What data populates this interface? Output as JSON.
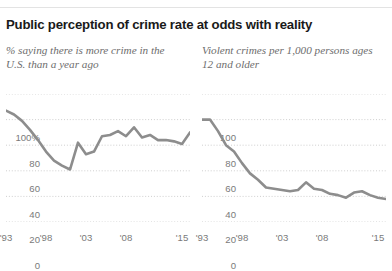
{
  "header": {
    "title": "Public perception of crime rate at odds with reality"
  },
  "colors": {
    "line": "#8d8d8d",
    "grid": "#c9c9c9",
    "title": "#1a1a1a",
    "subtitle": "#6d6d6d",
    "tick": "#7a7a7a",
    "rule": "#e3e3e3"
  },
  "chart_data": [
    {
      "type": "line",
      "id": "perception",
      "title": "% saying there is more crime in the U.S. than a year ago",
      "xlabel": "",
      "ylabel": "",
      "ylim": [
        0,
        100
      ],
      "xlim": [
        1993,
        2016
      ],
      "yticks": [
        "0",
        "20",
        "40",
        "60",
        "80",
        "100%"
      ],
      "ytick_values": [
        0,
        20,
        40,
        60,
        80,
        100
      ],
      "xticks": [
        "'93",
        "'98",
        "'03",
        "'08",
        "'15"
      ],
      "xtick_values": [
        1993,
        1998,
        2003,
        2008,
        2015
      ],
      "grid": "horizontal-dotted",
      "legend": "none",
      "x": [
        1993,
        1994,
        1995,
        1996,
        1997,
        1998,
        1999,
        2000,
        2001,
        2002,
        2003,
        2004,
        2005,
        2006,
        2007,
        2008,
        2009,
        2010,
        2011,
        2012,
        2013,
        2014,
        2015,
        2016
      ],
      "values": [
        87,
        84,
        79,
        72,
        64,
        55,
        48,
        44,
        41,
        62,
        53,
        55,
        67,
        68,
        71,
        67,
        74,
        66,
        68,
        64,
        64,
        63,
        61,
        70
      ]
    },
    {
      "type": "line",
      "id": "violent-crime-rate",
      "title": "Violent crimes per 1,000 persons ages 12 and older",
      "xlabel": "",
      "ylabel": "",
      "ylim": [
        0,
        100
      ],
      "xlim": [
        1993,
        2016
      ],
      "yticks": [
        "0",
        "20",
        "40",
        "60",
        "80",
        "100"
      ],
      "ytick_values": [
        0,
        20,
        40,
        60,
        80,
        100
      ],
      "xticks": [
        "'93",
        "'98",
        "'03",
        "'08",
        "'15"
      ],
      "xtick_values": [
        1993,
        1998,
        2003,
        2008,
        2015
      ],
      "grid": "horizontal-dotted",
      "legend": "none",
      "x": [
        1993,
        1994,
        1995,
        1996,
        1997,
        1998,
        1999,
        2000,
        2001,
        2002,
        2003,
        2004,
        2005,
        2006,
        2007,
        2008,
        2009,
        2010,
        2011,
        2012,
        2013,
        2014,
        2015,
        2016
      ],
      "values": [
        80,
        80,
        71,
        60,
        55,
        46,
        38,
        33,
        27,
        26,
        25,
        24,
        25,
        31,
        26,
        25,
        22,
        21,
        19,
        23,
        24,
        21,
        19,
        18
      ]
    }
  ]
}
